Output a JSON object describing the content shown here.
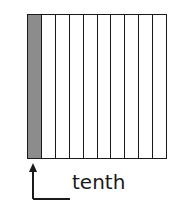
{
  "diagram": {
    "type": "tenths-model",
    "total_parts": 10,
    "shaded_parts": 1,
    "shaded_color": "#8c8c8c",
    "line_color": "#1a1a1a",
    "label": "tenth"
  }
}
